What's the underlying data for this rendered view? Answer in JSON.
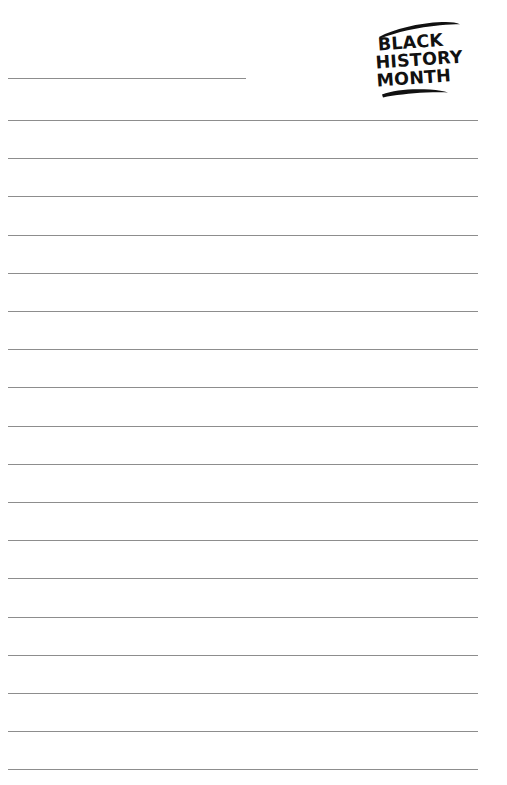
{
  "page": {
    "kind": "printable-worksheet",
    "background_color": "#ffffff",
    "width": 507,
    "height": 785
  },
  "logo": {
    "name": "black-history-month-stamp",
    "style": "hand-painted brush lettering",
    "ink_color": "#111111",
    "lines": [
      "BLACK",
      "HISTORY",
      "MONTH"
    ],
    "line1": "BLACK",
    "line2": "HISTORY",
    "line3": "MONTH",
    "top_stroke": "brush-swoosh",
    "bottom_stroke": "brush-underline"
  },
  "title_field": {
    "label": "",
    "placeholder": "",
    "value": "",
    "rule_color": "#8d8d8d",
    "left": 8,
    "top": 78,
    "width": 238
  },
  "ruled_lines": {
    "count": 18,
    "color": "#8d8d8d",
    "thickness": 1,
    "left": 8,
    "width": 470,
    "first_top": 120,
    "spacing": 38.2,
    "tops": [
      120,
      158.2,
      196.4,
      234.6,
      272.8,
      311,
      349.2,
      387.4,
      425.6,
      463.8,
      502,
      540.2,
      578.4,
      616.6,
      654.8,
      693,
      731.2,
      769.4
    ]
  }
}
